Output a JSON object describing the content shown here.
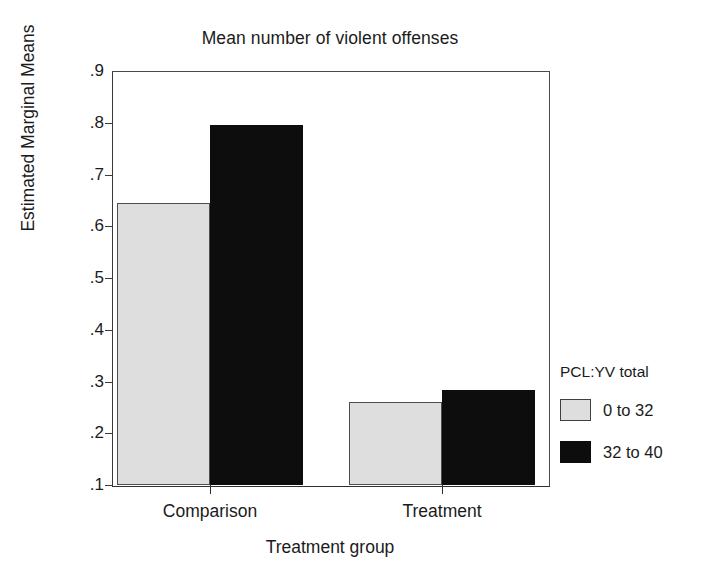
{
  "chart_data": {
    "type": "bar",
    "title": "Mean number of violent offenses",
    "xlabel": "Treatment group",
    "ylabel": "Estimated Marginal Means",
    "categories": [
      "Comparison",
      "Treatment"
    ],
    "series": [
      {
        "name": "0 to 32",
        "values": [
          0.645,
          0.26
        ],
        "color": "#dedede"
      },
      {
        "name": "32 to 40",
        "values": [
          0.795,
          0.283
        ],
        "color": "#0d0d0d"
      }
    ],
    "legend_title": "PCL:YV total",
    "legend_position": "right",
    "ylim": [
      0.1,
      0.9
    ],
    "yticks": [
      0.9,
      0.8,
      0.7,
      0.6,
      0.5,
      0.4,
      0.3,
      0.2,
      0.1
    ],
    "ytick_labels": [
      ".9",
      ".8",
      ".7",
      ".6",
      ".5",
      ".4",
      ".3",
      ".2",
      ".1"
    ],
    "grid": false
  }
}
